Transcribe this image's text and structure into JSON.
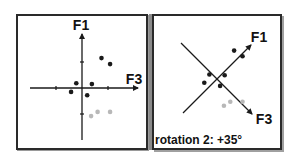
{
  "panels": [
    {
      "name": "original",
      "axes": {
        "vertical": "F1",
        "horizontal": "F3"
      },
      "caption": ""
    },
    {
      "name": "rotated",
      "axes": {
        "vertical": "F1",
        "horizontal": "F3"
      },
      "caption": "rotation 2: +35°",
      "rotation_degrees": 35
    }
  ],
  "points": [
    {
      "f3": 0.75,
      "f1": 1.15,
      "group": "dark"
    },
    {
      "f3": 1.08,
      "f1": 0.92,
      "group": "dark"
    },
    {
      "f3": -0.22,
      "f1": 0.18,
      "group": "dark"
    },
    {
      "f3": 0.38,
      "f1": 0.15,
      "group": "dark"
    },
    {
      "f3": -0.42,
      "f1": -0.15,
      "group": "dark"
    },
    {
      "f3": 0.2,
      "f1": -0.28,
      "group": "dark"
    },
    {
      "f3": 0.6,
      "f1": -0.92,
      "group": "light"
    },
    {
      "f3": 1.08,
      "f1": -0.92,
      "group": "light"
    },
    {
      "f3": 0.35,
      "f1": -1.08,
      "group": "light"
    }
  ],
  "colors": {
    "dark": "#1a1a1a",
    "light": "#b8b8b8",
    "axis": "#1a1a1a"
  }
}
